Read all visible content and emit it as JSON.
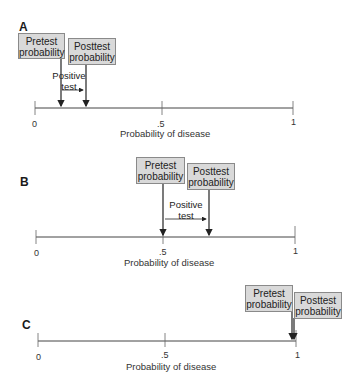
{
  "panels": [
    {
      "label": "A",
      "pretest_label": "Pretest probability",
      "posttest_label": "Posttest probability",
      "test_label_1": "Positive",
      "test_label_2": "test",
      "pretest_value": 0.1,
      "posttest_value": 0.2
    },
    {
      "label": "B",
      "pretest_label": "Pretest probability",
      "posttest_label": "Posttest probability",
      "test_label_1": "Positive",
      "test_label_2": "test",
      "pretest_value": 0.5,
      "posttest_value": 0.67
    },
    {
      "label": "C",
      "pretest_label": "Pretest probability",
      "posttest_label": "Posttest probability",
      "pretest_value": 0.99,
      "posttest_value": 0.995
    }
  ],
  "axis": {
    "ticks": [
      "0",
      ".5",
      "1"
    ],
    "title": "Probability of disease"
  },
  "colors": {
    "box_fill": "#d9d9d9",
    "box_border": "#8a8a8a",
    "line": "#333333"
  }
}
